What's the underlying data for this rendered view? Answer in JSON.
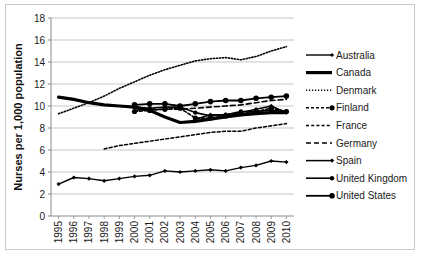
{
  "chart_data": {
    "type": "line",
    "title": "",
    "xlabel": "",
    "ylabel": "Nurses per 1,000 population",
    "ylim": [
      0,
      18
    ],
    "ytick_step": 2,
    "yticks": [
      "0",
      "2",
      "4",
      "6",
      "8",
      "10",
      "12",
      "14",
      "16",
      "18"
    ],
    "grid": true,
    "legend_position": "right",
    "categories": [
      "1995",
      "1996",
      "1997",
      "1998",
      "1999",
      "2000",
      "2001",
      "2002",
      "2003",
      "2004",
      "2005",
      "2006",
      "2007",
      "2008",
      "2009",
      "2010"
    ],
    "series": [
      {
        "name": "Australia",
        "style": "solid-thin-diamond",
        "values": [
          2.9,
          3.5,
          3.4,
          3.2,
          3.4,
          3.6,
          3.7,
          4.1,
          4.0,
          4.1,
          4.2,
          4.1,
          4.4,
          4.6,
          5.0,
          4.9
        ]
      },
      {
        "name": "Canada",
        "style": "solid-thick",
        "values": [
          10.8,
          10.6,
          10.3,
          10.1,
          10.0,
          9.9,
          9.6,
          9.0,
          8.5,
          8.6,
          8.8,
          9.0,
          9.2,
          9.3,
          9.4,
          9.4
        ]
      },
      {
        "name": "Denmark",
        "style": "dotted",
        "values": [
          9.3,
          9.8,
          10.3,
          10.9,
          11.6,
          12.2,
          12.8,
          13.3,
          13.7,
          14.1,
          14.3,
          14.4,
          14.2,
          14.5,
          15.0,
          15.4
        ]
      },
      {
        "name": "Finland",
        "style": "dashed-marker",
        "values": [
          null,
          null,
          null,
          null,
          null,
          9.5,
          9.6,
          9.7,
          9.8,
          8.9,
          8.9,
          9.1,
          9.3,
          9.5,
          9.8,
          9.5
        ]
      },
      {
        "name": "France",
        "style": "dashed-small",
        "values": [
          null,
          null,
          null,
          6.1,
          6.4,
          6.6,
          6.8,
          7.0,
          7.2,
          7.4,
          7.6,
          7.7,
          7.7,
          8.0,
          8.2,
          8.4
        ]
      },
      {
        "name": "Germany",
        "style": "dashed-long",
        "values": [
          null,
          null,
          null,
          null,
          null,
          9.6,
          9.7,
          9.7,
          9.7,
          9.8,
          9.9,
          10.0,
          10.1,
          10.3,
          10.5,
          10.6
        ]
      },
      {
        "name": "Spain",
        "style": "solid-smalldiamond",
        "values": [
          null,
          null,
          null,
          null,
          null,
          null,
          null,
          null,
          null,
          8.8,
          9.2,
          9.2,
          9.4,
          9.7,
          10.0,
          9.4
        ]
      },
      {
        "name": "United Kingdom",
        "style": "solid-dot",
        "values": [
          null,
          null,
          null,
          null,
          null,
          9.9,
          9.8,
          9.9,
          9.9,
          9.4,
          9.1,
          9.2,
          9.5,
          9.5,
          9.6,
          9.5
        ]
      },
      {
        "name": "United States",
        "style": "solid-bigdot",
        "values": [
          null,
          null,
          null,
          null,
          null,
          10.1,
          10.2,
          10.2,
          10.0,
          10.2,
          10.4,
          10.5,
          10.5,
          10.7,
          10.8,
          10.9
        ]
      }
    ]
  },
  "legend": {
    "items": [
      {
        "label": "Australia"
      },
      {
        "label": "Canada"
      },
      {
        "label": "Denmark"
      },
      {
        "label": "Finland"
      },
      {
        "label": "France"
      },
      {
        "label": "Germany"
      },
      {
        "label": "Spain"
      },
      {
        "label": "United Kingdom"
      },
      {
        "label": "United States"
      }
    ]
  }
}
